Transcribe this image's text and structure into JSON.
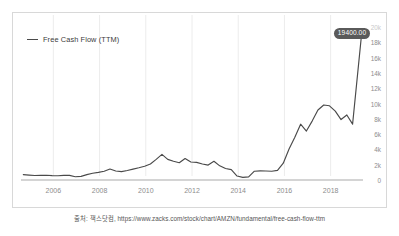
{
  "legend": {
    "label": "Free Cash Flow (TTM)",
    "line_color": "#4a4a4a"
  },
  "tooltip": {
    "value_label": "19400.00",
    "background": "#5a5a5a",
    "text_color": "#ffffff"
  },
  "caption": {
    "text": "출처: 잭스닷컴, https://www.zacks.com/stock/chart/AMZN/fundamental/free-cash-flow-ttm"
  },
  "chart_data": {
    "type": "line",
    "title": "",
    "subtitle": "",
    "xlabel": "",
    "ylabel": "",
    "grid": "vertical",
    "legend_position": "top-left",
    "y_axis_position": "right",
    "line_color": "#4a4a4a",
    "xlim": [
      2004.6,
      2019.4
    ],
    "ylim": [
      0,
      20000
    ],
    "xticks": [
      2006,
      2008,
      2010,
      2012,
      2014,
      2016,
      2018
    ],
    "xtick_labels": [
      "2006",
      "2008",
      "2010",
      "2012",
      "2014",
      "2016",
      "2018"
    ],
    "yticks": [
      0,
      2000,
      4000,
      6000,
      8000,
      10000,
      12000,
      14000,
      16000,
      18000,
      20000
    ],
    "ytick_labels": [
      "0",
      "2k",
      "4k",
      "6k",
      "8k",
      "10k",
      "12k",
      "14k",
      "16k",
      "18k",
      "20k"
    ],
    "annotations": [
      {
        "label": "19400.00",
        "x": 2019.35,
        "y": 19400
      }
    ],
    "series": [
      {
        "name": "Free Cash Flow (TTM)",
        "x": [
          2004.7,
          2004.95,
          2005.2,
          2005.45,
          2005.7,
          2005.95,
          2006.2,
          2006.45,
          2006.7,
          2006.95,
          2007.2,
          2007.45,
          2007.7,
          2007.95,
          2008.2,
          2008.45,
          2008.7,
          2008.95,
          2009.2,
          2009.45,
          2009.7,
          2009.95,
          2010.2,
          2010.45,
          2010.7,
          2010.95,
          2011.2,
          2011.45,
          2011.7,
          2011.95,
          2012.2,
          2012.45,
          2012.7,
          2012.95,
          2013.2,
          2013.45,
          2013.7,
          2013.95,
          2014.2,
          2014.45,
          2014.7,
          2014.95,
          2015.2,
          2015.45,
          2015.7,
          2015.95,
          2016.2,
          2016.45,
          2016.7,
          2016.95,
          2017.2,
          2017.45,
          2017.7,
          2017.95,
          2018.2,
          2018.45,
          2018.7,
          2018.95,
          2019.35
        ],
        "values": [
          700,
          640,
          590,
          600,
          620,
          570,
          560,
          610,
          600,
          420,
          480,
          700,
          880,
          1000,
          1150,
          1430,
          1180,
          1100,
          1250,
          1420,
          1600,
          1800,
          2100,
          2700,
          3350,
          2700,
          2450,
          2250,
          2800,
          2350,
          2300,
          2100,
          1950,
          2450,
          1850,
          1500,
          1350,
          520,
          350,
          400,
          1150,
          1200,
          1180,
          1150,
          1250,
          2200,
          4050,
          5600,
          7300,
          6400,
          7700,
          9150,
          9800,
          9700,
          9000,
          7900,
          8500,
          7300,
          19400
        ]
      }
    ]
  },
  "axis": {
    "ytick_labels": [
      "20k",
      "18k",
      "16k",
      "14k",
      "12k",
      "10k",
      "8k",
      "6k",
      "4k",
      "2k",
      "0"
    ],
    "xtick_labels": [
      "2006",
      "2008",
      "2010",
      "2012",
      "2014",
      "2016",
      "2018"
    ]
  }
}
